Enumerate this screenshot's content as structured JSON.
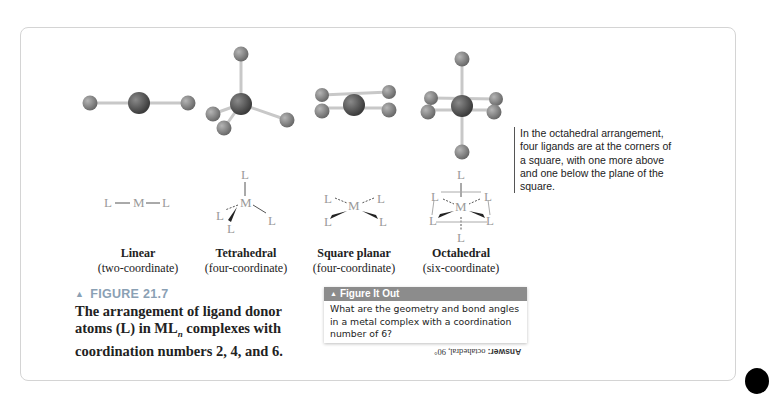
{
  "figure": {
    "number_label": "FIGURE 21.7",
    "caption": "The arrangement of ligand donor atoms (L) in ML complexes with coordination numbers 2, 4, and 6.",
    "caption_parts": {
      "before_sub": "The arrangement of ligand donor atoms (L) in ML",
      "sub": "n",
      "after_sub": " complexes with coordination numbers 2, 4, and 6."
    }
  },
  "geometries": [
    {
      "name": "Linear",
      "coordination": "(two-coordinate)"
    },
    {
      "name": "Tetrahedral",
      "coordination": "(four-coordinate)"
    },
    {
      "name": "Square planar",
      "coordination": "(four-coordinate)"
    },
    {
      "name": "Octahedral",
      "coordination": "(six-coordinate)"
    }
  ],
  "symbols": {
    "metal": "M",
    "ligand": "L"
  },
  "annotation": "In the octahedral arrangement, four ligands are at the corners of a square, with one more above and one below the plane of the square.",
  "figure_it_out": {
    "header": "Figure It Out",
    "question": "What are the geometry and bond angles in a metal complex with a coordination number of 6?",
    "answer_label": "Answer:",
    "answer": "octahedral, 90°"
  },
  "colors": {
    "metal_atom": "#555555",
    "ligand_atom": "#8a8a8a",
    "bond": "#c8c8c8",
    "figure_number": "#8aa0b4",
    "fio_header_bg": "#8c8c8c",
    "frame_border": "#d4d4d4"
  }
}
